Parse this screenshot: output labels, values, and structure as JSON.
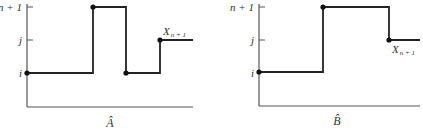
{
  "panels": [
    {
      "caption": "Â",
      "y_ticks": [
        "n + 1",
        "j",
        "i"
      ],
      "annotation": "X",
      "annotation_sub": "n + 1",
      "path_levels": [
        "i",
        "n + 1",
        "i",
        "j"
      ]
    },
    {
      "caption": "B̂",
      "y_ticks": [
        "n + 1",
        "j",
        "i"
      ],
      "annotation": "X",
      "annotation_sub": "n + 1",
      "path_levels": [
        "i",
        "n + 1",
        "j"
      ]
    }
  ],
  "colors": {
    "line": "#222222",
    "axis": "#555555"
  }
}
